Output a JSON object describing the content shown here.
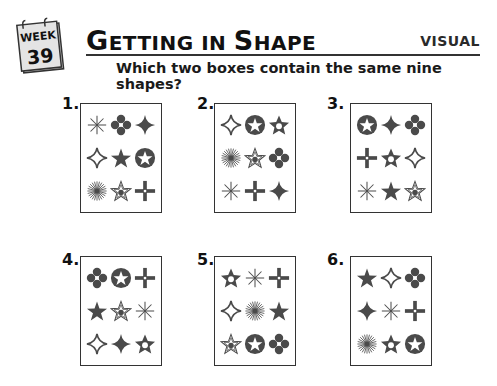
{
  "header": {
    "week_label": "WEEK",
    "week_number": "39",
    "title_parts": [
      {
        "text": "G",
        "size": "big"
      },
      {
        "text": "ETTING IN ",
        "size": "small"
      },
      {
        "text": "S",
        "size": "big"
      },
      {
        "text": "HAPE",
        "size": "small"
      }
    ],
    "title": "Getting in Shape",
    "category": "VISUAL",
    "question": "Which two boxes contain the same nine shapes?"
  },
  "colors": {
    "shape_fill": "#4a4a4a",
    "box_border": "#333333",
    "text": "#111111"
  },
  "boxes": [
    {
      "label": "1.",
      "shapes": [
        "asterisk",
        "quatrefoil",
        "diamond-star-solid",
        "diamond-star-outline",
        "star-solid",
        "star-in-circle",
        "sunburst",
        "star-outline-dot",
        "cross-dot"
      ]
    },
    {
      "label": "2.",
      "shapes": [
        "diamond-star-outline",
        "star-in-circle",
        "star-hollow-center",
        "sunburst",
        "star-outline-dot",
        "quatrefoil",
        "asterisk",
        "cross-dot",
        "diamond-star-solid"
      ]
    },
    {
      "label": "3.",
      "shapes": [
        "star-in-circle",
        "diamond-star-solid",
        "quatrefoil",
        "cross-dot",
        "star-hollow-center",
        "diamond-star-outline",
        "asterisk",
        "star-solid",
        "star-outline-dot"
      ]
    },
    {
      "label": "4.",
      "shapes": [
        "quatrefoil",
        "star-in-circle",
        "cross-dot",
        "star-solid",
        "star-outline-dot",
        "asterisk",
        "diamond-star-outline",
        "diamond-star-solid",
        "star-hollow-center"
      ]
    },
    {
      "label": "5.",
      "shapes": [
        "star-hollow-center",
        "asterisk",
        "cross-dot",
        "diamond-star-outline",
        "sunburst",
        "star-solid",
        "star-outline-dot",
        "star-in-circle",
        "quatrefoil"
      ]
    },
    {
      "label": "6.",
      "shapes": [
        "star-solid",
        "diamond-star-outline",
        "quatrefoil",
        "diamond-star-solid",
        "asterisk",
        "cross-dot",
        "sunburst",
        "star-hollow-center",
        "star-in-circle"
      ]
    }
  ]
}
